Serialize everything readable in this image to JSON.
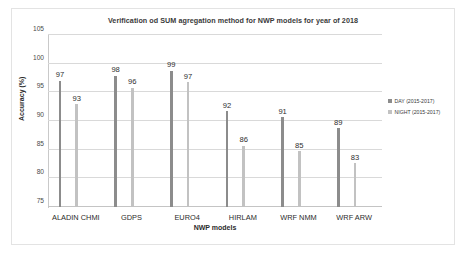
{
  "chart_data": {
    "type": "bar",
    "title": "Verification od SUM agregation method for NWP models for year of 2018",
    "xlabel": "NWP models",
    "ylabel": "Accuracy (%)",
    "categories": [
      "ALADIN CHMI",
      "GDPS",
      "EURO4",
      "HIRLAM",
      "WRF NMM",
      "WRF ARW"
    ],
    "series": [
      {
        "name": "DAY (2015-2017)",
        "color": "#8c8c8c",
        "values": [
          97,
          98,
          99,
          92,
          91,
          89
        ],
        "plotted": [
          97.0,
          97.9,
          98.8,
          91.7,
          90.7,
          88.7
        ]
      },
      {
        "name": "NIGHT (2015-2017)",
        "color": "#c2c2c2",
        "values": [
          93,
          96,
          97,
          86,
          85,
          83
        ],
        "plotted": [
          92.9,
          95.8,
          96.8,
          85.7,
          84.7,
          82.6
        ]
      }
    ],
    "ylim": [
      75,
      105
    ],
    "yticks": [
      105,
      100,
      95,
      90,
      85,
      80,
      75
    ],
    "grid": true,
    "legend_position": "right"
  }
}
